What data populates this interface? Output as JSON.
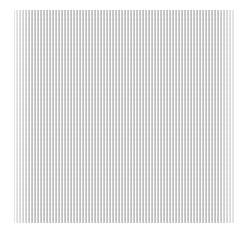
{
  "image": {
    "subject": "fabric-texture",
    "description": "Fine vertical gray stripes on white, resembling woven fabric or linen texture",
    "colors": {
      "background": "#ffffff",
      "stripe": "#969696",
      "base": "#f2f2f2"
    }
  }
}
